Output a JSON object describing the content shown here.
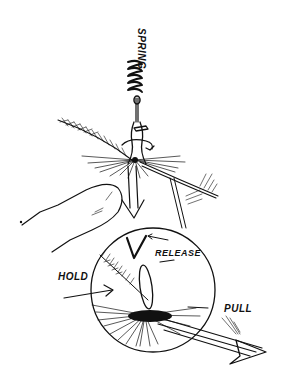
{
  "figure": {
    "ink_color": "#111111",
    "background_color": "#ffffff",
    "labels": {
      "spring": "SPRING",
      "release": "RELEASE",
      "hold": "HOLD",
      "pull": "PULL"
    }
  }
}
